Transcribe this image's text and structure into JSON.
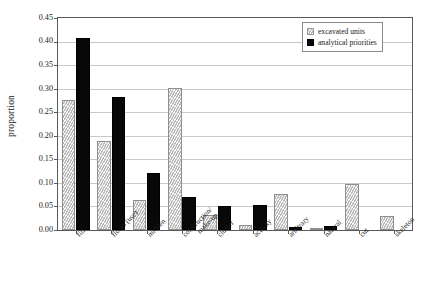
{
  "chart_data": {
    "type": "bar",
    "title": "",
    "xlabel": "",
    "ylabel": "proportion",
    "ylim": [
      0.0,
      0.45
    ],
    "yticks": [
      "0.00",
      "0.05",
      "0.10",
      "0.15",
      "0.20",
      "0.25",
      "0.30",
      "0.35",
      "0.40",
      "0.45"
    ],
    "ytick_values": [
      0.0,
      0.05,
      0.1,
      0.15,
      0.2,
      0.25,
      0.3,
      0.35,
      0.4,
      0.45
    ],
    "grid": true,
    "legend_position": "top-right",
    "categories": [
      "fill",
      "floors (use)",
      "midden",
      "construction/\nmake-up",
      "cluster",
      "activity",
      "arbitrary",
      "natural",
      "cut",
      "skeleton"
    ],
    "category_lines": [
      [
        "fill"
      ],
      [
        "floors (use)"
      ],
      [
        "midden"
      ],
      [
        "construction/",
        "make-up"
      ],
      [
        "cluster"
      ],
      [
        "activity"
      ],
      [
        "arbitrary"
      ],
      [
        "natural"
      ],
      [
        "cut"
      ],
      [
        "skeleton"
      ]
    ],
    "series": [
      {
        "name": "excavated units",
        "color": "#d0d0d0",
        "pattern": "diagonal-hatch",
        "values": [
          0.277,
          0.19,
          0.064,
          0.302,
          0.032,
          0.01,
          0.077,
          0.002,
          0.097,
          0.029
        ]
      },
      {
        "name": "analytical priorities",
        "color": "#080808",
        "pattern": "solid",
        "values": [
          0.407,
          0.283,
          0.122,
          0.07,
          0.051,
          0.054,
          0.006,
          0.009,
          0.0,
          0.0
        ]
      }
    ]
  },
  "legend": {
    "items": [
      {
        "label": "excavated units"
      },
      {
        "label": "analytical priorities"
      }
    ]
  }
}
